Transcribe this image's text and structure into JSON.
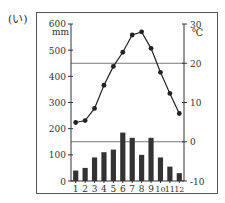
{
  "panel_label": "(い)",
  "chart_data": {
    "type": "bar+line",
    "title": "",
    "categories": [
      "1",
      "2",
      "3",
      "4",
      "5",
      "6",
      "7",
      "8",
      "9",
      "10",
      "11",
      "12"
    ],
    "series": [
      {
        "name": "precipitation",
        "type": "bar",
        "unit": "mm",
        "axis": "left",
        "values": [
          40,
          50,
          90,
          110,
          120,
          185,
          165,
          100,
          165,
          90,
          55,
          30
        ]
      },
      {
        "name": "temperature",
        "type": "line",
        "unit": "℃",
        "axis": "right",
        "values": [
          4.9,
          5.4,
          8.5,
          14.4,
          19.2,
          22.8,
          27.2,
          28.0,
          23.8,
          17.7,
          12.3,
          7.2
        ]
      }
    ],
    "left_axis": {
      "label": "mm",
      "ticks": [
        0,
        100,
        200,
        300,
        400,
        500,
        600
      ],
      "ylim": [
        0,
        600
      ]
    },
    "right_axis": {
      "label": "℃",
      "ticks": [
        -10,
        0,
        10,
        20,
        30
      ],
      "ylim": [
        -10,
        30
      ]
    },
    "gridlines": {
      "right_axis_values": [
        0,
        20
      ]
    },
    "xlabel": "",
    "legend": "none",
    "colors": {
      "bar": "#333333",
      "line": "#222222",
      "grid": "#555555"
    }
  }
}
